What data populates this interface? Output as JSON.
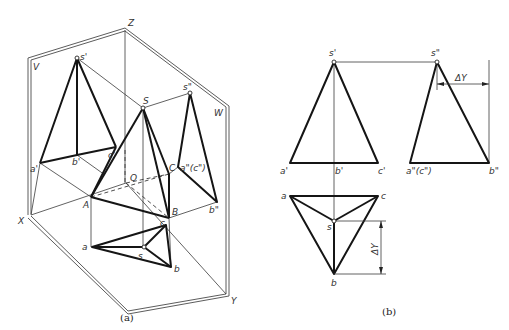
{
  "figure": {
    "subfigure_a": {
      "caption": "(a)",
      "planes": {
        "V": "V",
        "W": "W",
        "H_axis_labels": {
          "X": "X",
          "Y": "Y",
          "Z": "Z",
          "O": "O"
        }
      },
      "space_points": {
        "S": "S",
        "A": "A",
        "B": "B",
        "C": "C"
      },
      "front_view_points": {
        "s_prime": "s'",
        "a_prime": "a'",
        "b_prime": "b'",
        "c_prime": "c'"
      },
      "side_view_points": {
        "s_dprime": "s\"",
        "a_c_dprime": "a\"(c\")",
        "b_dprime": "b\""
      },
      "top_view_points": {
        "s": "s",
        "a": "a",
        "b": "b",
        "c": "c"
      }
    },
    "subfigure_b": {
      "caption": "(b)",
      "front_view_points": {
        "s_prime": "s'",
        "a_prime": "a'",
        "b_prime": "b'",
        "c_prime": "c'"
      },
      "side_view_points": {
        "s_dprime": "s\"",
        "a_c_dprime": "a\"(c\")",
        "b_dprime": "b\""
      },
      "top_view_points": {
        "s": "s",
        "a": "a",
        "b": "b",
        "c": "c"
      },
      "dimension_side": "ΔY",
      "dimension_top": "ΔY"
    }
  }
}
